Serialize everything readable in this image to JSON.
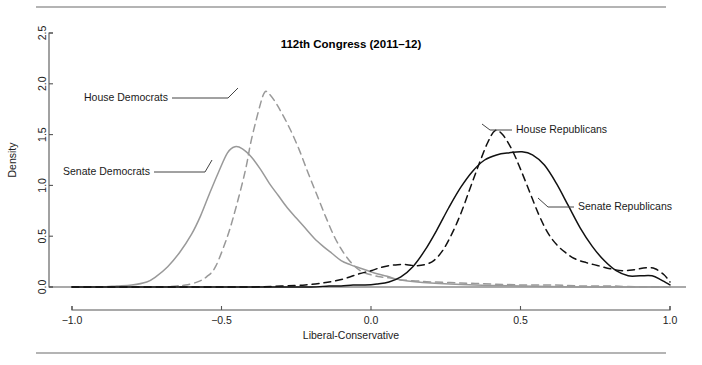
{
  "figure": {
    "background_color": "#ffffff",
    "rule_color": "#b4b4b4",
    "top_rule_name": "top-divider",
    "bottom_rule_name": "bottom-divider"
  },
  "chart_data": {
    "type": "line",
    "title": "112th Congress (2011–12)",
    "xlabel": "Liberal-Conservative",
    "ylabel": "Density",
    "xlim": [
      -1.0,
      1.0
    ],
    "ylim": [
      0.0,
      2.5
    ],
    "xticks": [
      "-1.0",
      "-0.5",
      "0.0",
      "0.5",
      "1.0"
    ],
    "xtick_values": [
      -1.0,
      -0.5,
      0.0,
      0.5,
      1.0
    ],
    "yticks": [
      "0.0",
      "0.5",
      "1.0",
      "1.5",
      "2.0",
      "2.5"
    ],
    "ytick_values": [
      0.0,
      0.5,
      1.0,
      1.5,
      2.0,
      2.5
    ],
    "grid": false,
    "legend_position": "inline-annotations",
    "series": [
      {
        "name": "House Democrats",
        "color": "#999999",
        "style": "dashed",
        "label_x": 168,
        "label_y": 101,
        "label_anchor": "end",
        "leader": [
          [
            172,
            98
          ],
          [
            228,
            98
          ],
          [
            238,
            88
          ]
        ],
        "peak_x": -0.355,
        "peak_y": 1.92,
        "x": [
          -0.95,
          -0.9,
          -0.85,
          -0.8,
          -0.75,
          -0.7,
          -0.65,
          -0.62,
          -0.58,
          -0.55,
          -0.52,
          -0.48,
          -0.45,
          -0.42,
          -0.4,
          -0.37,
          -0.355,
          -0.34,
          -0.32,
          -0.3,
          -0.27,
          -0.24,
          -0.21,
          -0.18,
          -0.15,
          -0.12,
          -0.09,
          -0.06,
          -0.03,
          0.0,
          0.03,
          0.06,
          0.1,
          0.15,
          0.2,
          0.3,
          0.4,
          0.5,
          0.6,
          0.7,
          0.8,
          0.9,
          1.0
        ],
        "y": [
          0.0,
          0.0,
          0.0,
          0.0,
          0.0,
          0.0,
          0.01,
          0.02,
          0.05,
          0.1,
          0.2,
          0.5,
          0.8,
          1.15,
          1.45,
          1.8,
          1.92,
          1.9,
          1.82,
          1.72,
          1.55,
          1.35,
          1.12,
          0.9,
          0.68,
          0.48,
          0.33,
          0.22,
          0.15,
          0.12,
          0.1,
          0.09,
          0.07,
          0.06,
          0.05,
          0.04,
          0.03,
          0.02,
          0.02,
          0.01,
          0.01,
          0.0,
          0.0
        ]
      },
      {
        "name": "Senate Democrats",
        "color": "#999999",
        "style": "solid",
        "label_x": 150,
        "label_y": 175,
        "label_anchor": "end",
        "leader": [
          [
            154,
            172
          ],
          [
            205,
            172
          ],
          [
            212,
            160
          ]
        ],
        "peak_x": -0.455,
        "peak_y": 1.38,
        "x": [
          -1.0,
          -0.95,
          -0.9,
          -0.85,
          -0.8,
          -0.75,
          -0.72,
          -0.68,
          -0.64,
          -0.6,
          -0.57,
          -0.54,
          -0.51,
          -0.48,
          -0.455,
          -0.43,
          -0.4,
          -0.37,
          -0.34,
          -0.31,
          -0.28,
          -0.25,
          -0.22,
          -0.19,
          -0.16,
          -0.13,
          -0.1,
          -0.07,
          -0.04,
          -0.01,
          0.02,
          0.06,
          0.1,
          0.2,
          0.35,
          0.5,
          0.7,
          0.85,
          1.0
        ],
        "y": [
          0.0,
          0.0,
          0.0,
          0.01,
          0.02,
          0.05,
          0.1,
          0.2,
          0.34,
          0.52,
          0.7,
          0.92,
          1.13,
          1.32,
          1.38,
          1.36,
          1.28,
          1.16,
          1.02,
          0.9,
          0.78,
          0.68,
          0.58,
          0.48,
          0.4,
          0.33,
          0.26,
          0.22,
          0.19,
          0.16,
          0.13,
          0.1,
          0.07,
          0.04,
          0.02,
          0.01,
          0.0,
          0.0,
          0.0
        ]
      },
      {
        "name": "House Republicans",
        "color": "#111111",
        "style": "dashed",
        "label_x": 516,
        "label_y": 133,
        "label_anchor": "start",
        "leader": [
          [
            512,
            130
          ],
          [
            490,
            130
          ],
          [
            482,
            124
          ]
        ],
        "peak_x": 0.415,
        "peak_y": 1.54,
        "x": [
          -1.0,
          -0.6,
          -0.4,
          -0.3,
          -0.22,
          -0.16,
          -0.12,
          -0.08,
          -0.04,
          0.0,
          0.03,
          0.06,
          0.09,
          0.12,
          0.15,
          0.18,
          0.21,
          0.24,
          0.27,
          0.3,
          0.33,
          0.36,
          0.39,
          0.415,
          0.44,
          0.47,
          0.5,
          0.53,
          0.56,
          0.59,
          0.62,
          0.65,
          0.68,
          0.72,
          0.76,
          0.8,
          0.84,
          0.88,
          0.92,
          0.95,
          0.98,
          1.0
        ],
        "y": [
          0.0,
          0.0,
          0.0,
          0.01,
          0.02,
          0.04,
          0.06,
          0.09,
          0.13,
          0.16,
          0.19,
          0.21,
          0.22,
          0.22,
          0.21,
          0.22,
          0.26,
          0.36,
          0.52,
          0.72,
          0.96,
          1.2,
          1.42,
          1.54,
          1.5,
          1.36,
          1.16,
          0.94,
          0.72,
          0.54,
          0.42,
          0.34,
          0.28,
          0.24,
          0.21,
          0.18,
          0.16,
          0.17,
          0.19,
          0.18,
          0.12,
          0.05
        ]
      },
      {
        "name": "Senate Republicans",
        "color": "#111111",
        "style": "solid",
        "label_x": 578,
        "label_y": 210,
        "label_anchor": "start",
        "leader": [
          [
            574,
            207
          ],
          [
            548,
            207
          ],
          [
            538,
            198
          ]
        ],
        "peak_x": 0.505,
        "peak_y": 1.33,
        "x": [
          -1.0,
          -0.5,
          -0.3,
          -0.2,
          -0.14,
          -0.1,
          -0.06,
          -0.02,
          0.02,
          0.06,
          0.1,
          0.14,
          0.18,
          0.22,
          0.26,
          0.3,
          0.34,
          0.38,
          0.42,
          0.46,
          0.505,
          0.54,
          0.58,
          0.62,
          0.66,
          0.7,
          0.74,
          0.78,
          0.82,
          0.86,
          0.9,
          0.94,
          0.97,
          1.0
        ],
        "y": [
          0.0,
          0.0,
          0.0,
          0.0,
          0.01,
          0.01,
          0.02,
          0.02,
          0.03,
          0.05,
          0.1,
          0.2,
          0.36,
          0.56,
          0.78,
          0.98,
          1.14,
          1.25,
          1.3,
          1.32,
          1.33,
          1.3,
          1.2,
          1.02,
          0.8,
          0.58,
          0.4,
          0.26,
          0.16,
          0.11,
          0.11,
          0.11,
          0.07,
          0.02
        ]
      }
    ]
  }
}
